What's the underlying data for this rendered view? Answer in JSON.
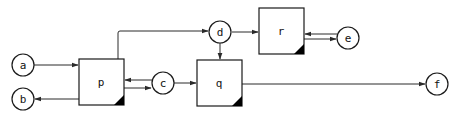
{
  "diagram": {
    "type": "block-flow",
    "nodes": [
      {
        "id": "a",
        "label": "a",
        "shape": "circle"
      },
      {
        "id": "b",
        "label": "b",
        "shape": "circle"
      },
      {
        "id": "p",
        "label": "p",
        "shape": "box"
      },
      {
        "id": "c",
        "label": "c",
        "shape": "circle"
      },
      {
        "id": "d",
        "label": "d",
        "shape": "circle"
      },
      {
        "id": "q",
        "label": "q",
        "shape": "box"
      },
      {
        "id": "r",
        "label": "r",
        "shape": "box"
      },
      {
        "id": "e",
        "label": "e",
        "shape": "circle"
      },
      {
        "id": "f",
        "label": "f",
        "shape": "circle"
      }
    ],
    "edges": [
      {
        "from": "a",
        "to": "p"
      },
      {
        "from": "p",
        "to": "b"
      },
      {
        "from": "c",
        "to": "p"
      },
      {
        "from": "p",
        "to": "c"
      },
      {
        "from": "p",
        "to": "d"
      },
      {
        "from": "c",
        "to": "q"
      },
      {
        "from": "d",
        "to": "q"
      },
      {
        "from": "d",
        "to": "r"
      },
      {
        "from": "e",
        "to": "r"
      },
      {
        "from": "r",
        "to": "e"
      },
      {
        "from": "q",
        "to": "f"
      }
    ]
  },
  "labels": {
    "a": "a",
    "b": "b",
    "c": "c",
    "d": "d",
    "e": "e",
    "f": "f",
    "p": "p",
    "q": "q",
    "r": "r"
  }
}
